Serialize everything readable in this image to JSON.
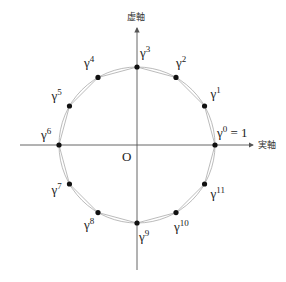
{
  "diagram": {
    "axes": {
      "real_label": "実軸",
      "imag_label": "虚軸",
      "origin_label": "O"
    },
    "center": [
      137,
      145
    ],
    "radius": 78,
    "points": [
      {
        "name": "gamma-0",
        "base": "γ",
        "exp": "0",
        "suffix": " = 1",
        "angle_deg": 0
      },
      {
        "name": "gamma-1",
        "base": "γ",
        "exp": "1",
        "suffix": "",
        "angle_deg": 30
      },
      {
        "name": "gamma-2",
        "base": "γ",
        "exp": "2",
        "suffix": "",
        "angle_deg": 60
      },
      {
        "name": "gamma-3",
        "base": "γ",
        "exp": "3",
        "suffix": "",
        "angle_deg": 90
      },
      {
        "name": "gamma-4",
        "base": "γ",
        "exp": "4",
        "suffix": "",
        "angle_deg": 120
      },
      {
        "name": "gamma-5",
        "base": "γ",
        "exp": "5",
        "suffix": "",
        "angle_deg": 150
      },
      {
        "name": "gamma-6",
        "base": "γ",
        "exp": "6",
        "suffix": "",
        "angle_deg": 180
      },
      {
        "name": "gamma-7",
        "base": "γ",
        "exp": "7",
        "suffix": "",
        "angle_deg": 210
      },
      {
        "name": "gamma-8",
        "base": "γ",
        "exp": "8",
        "suffix": "",
        "angle_deg": 240
      },
      {
        "name": "gamma-9",
        "base": "γ",
        "exp": "9",
        "suffix": "",
        "angle_deg": 270
      },
      {
        "name": "gamma-10",
        "base": "γ",
        "exp": "10",
        "suffix": "",
        "angle_deg": 300
      },
      {
        "name": "gamma-11",
        "base": "γ",
        "exp": "11",
        "suffix": "",
        "angle_deg": 330
      }
    ],
    "colors": {
      "axis": "#555555",
      "circle": "#aaaaaa",
      "point": "#111111"
    }
  }
}
